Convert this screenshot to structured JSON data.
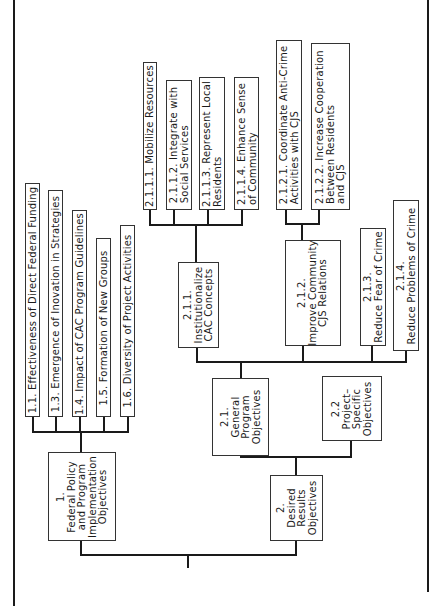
{
  "diagram": {
    "orientation": "rotated-90-ccw",
    "root": {
      "children": [
        {
          "id": "1",
          "lines": [
            "1.",
            "Federal Policy",
            "and Program",
            "Implementation",
            "Objectives"
          ],
          "children": [
            {
              "id": "1.1",
              "lines": [
                "1.1. Effectiveness of Direct Federal Funding"
              ]
            },
            {
              "id": "1.3",
              "lines": [
                "1.3. Emergence of Inovation in Strategies"
              ]
            },
            {
              "id": "1.4",
              "lines": [
                "1.4. Impact of CAC Program Guidelines"
              ]
            },
            {
              "id": "1.5",
              "lines": [
                "1.5. Formation of New Groups"
              ]
            },
            {
              "id": "1.6",
              "lines": [
                "1.6. Diversity of Project Activities"
              ]
            }
          ]
        },
        {
          "id": "2",
          "lines": [
            "2.",
            "Desired",
            "Results",
            "Objectives"
          ],
          "children": [
            {
              "id": "2.1",
              "lines": [
                "2.1.",
                "General",
                "Program",
                "Objectives"
              ],
              "children": [
                {
                  "id": "2.1.1",
                  "lines": [
                    "2.1.1.",
                    "Institutionalize",
                    "CAC  Concepts"
                  ],
                  "children": [
                    {
                      "id": "2.1.1.1",
                      "lines": [
                        "2.1.1.1. Mobilize  Resources"
                      ]
                    },
                    {
                      "id": "2.1.1.2",
                      "lines": [
                        "2.1.1.2. Integrate with",
                        "Social Services"
                      ]
                    },
                    {
                      "id": "2.1.1.3",
                      "lines": [
                        "2.1.1.3. Represent Local",
                        "Residents"
                      ]
                    },
                    {
                      "id": "2.1.1.4",
                      "lines": [
                        "2.1.1.4. Enhance  Sense",
                        "of Community"
                      ]
                    }
                  ]
                },
                {
                  "id": "2.1.2",
                  "lines": [
                    "2.1.2.",
                    "Improve Community",
                    "CJS  Relations"
                  ],
                  "children": [
                    {
                      "id": "2.1.2.1",
                      "lines": [
                        "2.1.2.1. Coordinate Anti-Crime",
                        "Activities with CJS"
                      ]
                    },
                    {
                      "id": "2.1.2.2",
                      "lines": [
                        "2.1.2.2. Increase Cooperation",
                        "Between  Residents",
                        "and  CJS"
                      ]
                    }
                  ]
                },
                {
                  "id": "2.1.3",
                  "lines": [
                    "2.1.3.",
                    "Reduce Fear of Crime"
                  ]
                },
                {
                  "id": "2.1.4",
                  "lines": [
                    "2.1.4.",
                    "Reduce  Problems of  Crime"
                  ]
                }
              ]
            },
            {
              "id": "2.2",
              "lines": [
                "2.2",
                "Project–",
                "Specific",
                "Objectives"
              ]
            }
          ]
        }
      ]
    }
  },
  "labels": {
    "n1": [
      "1.",
      "Federal Policy",
      "and Program",
      "Implementation",
      "Objectives"
    ],
    "n11": [
      "1.1. Effectiveness of Direct Federal Funding"
    ],
    "n13": [
      "1.3. Emergence of Inovation in Strategies"
    ],
    "n14": [
      "1.4. Impact of CAC Program Guidelines"
    ],
    "n15": [
      "1.5. Formation of New Groups"
    ],
    "n16": [
      "1.6. Diversity of Project Activities"
    ],
    "n2": [
      "2.",
      "Desired",
      "Results",
      "Objectives"
    ],
    "n21": [
      "2.1.",
      "General",
      "Program",
      "Objectives"
    ],
    "n22": [
      "2.2",
      "Project–",
      "Specific",
      "Objectives"
    ],
    "n211": [
      "2.1.1.",
      "Institutionalize",
      "CAC  Concepts"
    ],
    "n212": [
      "2.1.2.",
      "Improve Community",
      "CJS  Relations"
    ],
    "n213": [
      "2.1.3.",
      "Reduce Fear of Crime"
    ],
    "n214": [
      "2.1.4.",
      "Reduce  Problems of  Crime"
    ],
    "n2111": [
      "2.1.1.1. Mobilize  Resources"
    ],
    "n2112": [
      "2.1.1.2. Integrate with",
      "Social Services"
    ],
    "n2113": [
      "2.1.1.3. Represent Local",
      "Residents"
    ],
    "n2114": [
      "2.1.1.4. Enhance  Sense",
      "of Community"
    ],
    "n2121": [
      "2.1.2.1. Coordinate Anti-Crime",
      "Activities with CJS"
    ],
    "n2122": [
      "2.1.2.2. Increase Cooperation",
      "Between  Residents",
      "and  CJS"
    ]
  }
}
